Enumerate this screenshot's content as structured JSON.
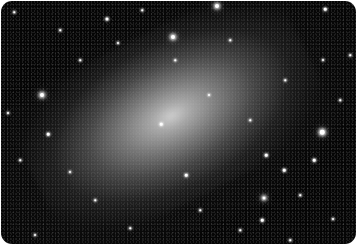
{
  "image": {
    "subject": "elliptical/spiral galaxy star field",
    "colors": {
      "background": "#050505",
      "galaxy_core": "#d7d7d7",
      "page": "#ffffff"
    },
    "galaxy": {
      "center_x": 160,
      "center_y": 124,
      "angle_deg": -27
    },
    "stars": [
      {
        "x": 217,
        "y": 6,
        "size": 4,
        "kind": "big"
      },
      {
        "x": 107,
        "y": 19,
        "size": 3,
        "kind": "mid"
      },
      {
        "x": 173,
        "y": 37,
        "size": 4,
        "kind": "big"
      },
      {
        "x": 325,
        "y": 9,
        "size": 2.5,
        "kind": "mid"
      },
      {
        "x": 118,
        "y": 43,
        "size": 2,
        "kind": "mid"
      },
      {
        "x": 42,
        "y": 95,
        "size": 4,
        "kind": "big"
      },
      {
        "x": 48,
        "y": 134,
        "size": 2.5,
        "kind": "mid"
      },
      {
        "x": 8,
        "y": 113,
        "size": 2,
        "kind": "mid"
      },
      {
        "x": 322,
        "y": 132,
        "size": 4.5,
        "kind": "big"
      },
      {
        "x": 266,
        "y": 155,
        "size": 2.5,
        "kind": "mid"
      },
      {
        "x": 314,
        "y": 160,
        "size": 2.5,
        "kind": "mid"
      },
      {
        "x": 284,
        "y": 170,
        "size": 2.5,
        "kind": "mid"
      },
      {
        "x": 264,
        "y": 198,
        "size": 3,
        "kind": "big"
      },
      {
        "x": 262,
        "y": 220,
        "size": 2.5,
        "kind": "mid"
      },
      {
        "x": 186,
        "y": 175,
        "size": 2.5,
        "kind": "mid"
      },
      {
        "x": 209,
        "y": 95,
        "size": 2,
        "kind": "mid"
      },
      {
        "x": 161,
        "y": 124,
        "size": 2.5,
        "kind": "mid"
      },
      {
        "x": 70,
        "y": 172,
        "size": 2,
        "kind": "mid"
      },
      {
        "x": 333,
        "y": 219,
        "size": 2,
        "kind": "mid"
      },
      {
        "x": 35,
        "y": 235,
        "size": 2,
        "kind": "mid"
      },
      {
        "x": 323,
        "y": 60,
        "size": 2,
        "kind": "mid"
      },
      {
        "x": 80,
        "y": 60,
        "size": 1.5,
        "kind": "mid"
      },
      {
        "x": 285,
        "y": 80,
        "size": 1.5,
        "kind": "mid"
      },
      {
        "x": 350,
        "y": 55,
        "size": 1.5,
        "kind": "mid"
      },
      {
        "x": 14,
        "y": 12,
        "size": 1.5,
        "kind": "mid"
      },
      {
        "x": 142,
        "y": 10,
        "size": 1.5,
        "kind": "mid"
      },
      {
        "x": 230,
        "y": 40,
        "size": 1.5,
        "kind": "mid"
      },
      {
        "x": 300,
        "y": 195,
        "size": 1.5,
        "kind": "mid"
      },
      {
        "x": 240,
        "y": 230,
        "size": 1.5,
        "kind": "mid"
      },
      {
        "x": 130,
        "y": 228,
        "size": 1.5,
        "kind": "mid"
      },
      {
        "x": 95,
        "y": 200,
        "size": 1.5,
        "kind": "mid"
      },
      {
        "x": 20,
        "y": 160,
        "size": 1.5,
        "kind": "mid"
      },
      {
        "x": 200,
        "y": 210,
        "size": 1.5,
        "kind": "mid"
      },
      {
        "x": 340,
        "y": 100,
        "size": 1.5,
        "kind": "mid"
      },
      {
        "x": 60,
        "y": 30,
        "size": 1.5,
        "kind": "mid"
      },
      {
        "x": 250,
        "y": 120,
        "size": 1.5,
        "kind": "mid"
      },
      {
        "x": 290,
        "y": 240,
        "size": 1.5,
        "kind": "mid"
      },
      {
        "x": 175,
        "y": 60,
        "size": 1.5,
        "kind": "mid"
      }
    ]
  }
}
